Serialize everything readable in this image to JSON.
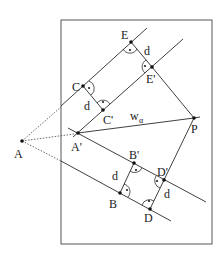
{
  "diagram": {
    "frame": {
      "x": 61,
      "y": 20,
      "width": 151,
      "height": 224
    },
    "points": {
      "A": {
        "label": "A",
        "x": 22,
        "y": 141
      },
      "A_prime": {
        "label": "A'",
        "x": 78,
        "y": 133
      },
      "C": {
        "label": "C",
        "x": 83,
        "y": 86
      },
      "C_prime": {
        "label": "C'",
        "x": 103,
        "y": 110
      },
      "E": {
        "label": "E",
        "x": 131,
        "y": 42
      },
      "E_prime": {
        "label": "E'",
        "x": 152,
        "y": 67
      },
      "P": {
        "label": "P",
        "x": 194,
        "y": 118
      },
      "B": {
        "label": "B",
        "x": 120,
        "y": 193
      },
      "B_prime": {
        "label": "B'",
        "x": 134,
        "y": 163
      },
      "D": {
        "label": "D",
        "x": 150,
        "y": 209
      },
      "D_prime": {
        "label": "D'",
        "x": 164,
        "y": 180
      }
    },
    "distance_labels": [
      "d",
      "d",
      "d",
      "d"
    ],
    "bisector_label": "w",
    "bisector_subscript": "α"
  }
}
